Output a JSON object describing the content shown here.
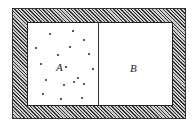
{
  "diagram": {
    "chambers": [
      {
        "label": "A",
        "contains": "gas"
      },
      {
        "label": "B",
        "contains": "empty"
      }
    ],
    "particles": [
      [
        50,
        34
      ],
      [
        73,
        31
      ],
      [
        84,
        40
      ],
      [
        36,
        48
      ],
      [
        70,
        47
      ],
      [
        89,
        54
      ],
      [
        58,
        55
      ],
      [
        41,
        64
      ],
      [
        66,
        67
      ],
      [
        93,
        69
      ],
      [
        46,
        80
      ],
      [
        78,
        78
      ],
      [
        74,
        82
      ],
      [
        64,
        85
      ],
      [
        84,
        84
      ],
      [
        43,
        94
      ],
      [
        61,
        99
      ],
      [
        82,
        98
      ]
    ],
    "colors": {
      "line": "#222222",
      "hatch": "#333333",
      "fill": "#ffffff"
    }
  }
}
